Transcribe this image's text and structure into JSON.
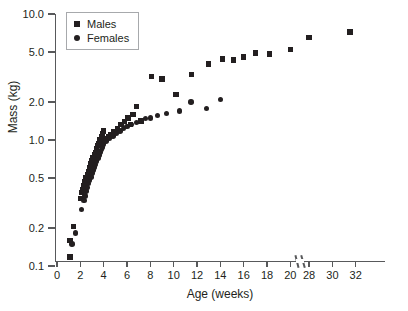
{
  "chart_data": {
    "type": "scatter",
    "title": "",
    "xlabel": "Age (weeks)",
    "ylabel": "Mass (kg)",
    "yscale": "log",
    "ylim": [
      0.1,
      10.0
    ],
    "ytick_labels": [
      "0.1",
      "0.2",
      "0.5",
      "1.0",
      "2.0",
      "5.0",
      "10.0"
    ],
    "ytick_values": [
      0.1,
      0.2,
      0.5,
      1.0,
      2.0,
      5.0,
      10.0
    ],
    "xlim": [
      0,
      32
    ],
    "xtick_labels": [
      "0",
      "2",
      "4",
      "6",
      "8",
      "10",
      "12",
      "14",
      "16",
      "18",
      "20",
      "28",
      "30",
      "32"
    ],
    "xtick_values": [
      0,
      2,
      4,
      6,
      8,
      10,
      12,
      14,
      16,
      18,
      20,
      28,
      30,
      32
    ],
    "axis_break": {
      "after": 20,
      "before": 28,
      "axis": "x"
    },
    "grid": false,
    "legend_position": "top-left",
    "marker_color": "#231f20",
    "axis_color": "#58595b",
    "series": [
      {
        "name": "Males",
        "marker": "square",
        "points": [
          [
            1.1,
            0.118
          ],
          [
            1.1,
            0.16
          ],
          [
            1.4,
            0.205
          ],
          [
            2.0,
            0.345
          ],
          [
            2.1,
            0.385
          ],
          [
            2.2,
            0.405
          ],
          [
            2.3,
            0.43
          ],
          [
            2.4,
            0.47
          ],
          [
            2.5,
            0.505
          ],
          [
            2.5,
            0.45
          ],
          [
            2.6,
            0.53
          ],
          [
            2.7,
            0.56
          ],
          [
            2.8,
            0.6
          ],
          [
            2.9,
            0.65
          ],
          [
            3.0,
            0.69
          ],
          [
            3.0,
            0.62
          ],
          [
            3.1,
            0.72
          ],
          [
            3.2,
            0.76
          ],
          [
            3.3,
            0.8
          ],
          [
            3.4,
            0.85
          ],
          [
            3.5,
            0.9
          ],
          [
            3.6,
            0.94
          ],
          [
            3.7,
            1.0
          ],
          [
            3.8,
            1.06
          ],
          [
            3.9,
            1.12
          ],
          [
            4.0,
            1.18
          ],
          [
            4.2,
            1.03
          ],
          [
            4.4,
            1.06
          ],
          [
            4.6,
            1.1
          ],
          [
            4.9,
            1.17
          ],
          [
            5.2,
            1.24
          ],
          [
            5.5,
            1.33
          ],
          [
            5.8,
            1.4
          ],
          [
            6.1,
            1.5
          ],
          [
            6.3,
            1.32
          ],
          [
            6.5,
            1.6
          ],
          [
            6.8,
            1.85
          ],
          [
            7.2,
            1.42
          ],
          [
            8.1,
            3.2
          ],
          [
            9.0,
            3.05
          ],
          [
            10.2,
            2.3
          ],
          [
            11.5,
            3.3
          ],
          [
            13.0,
            4.0
          ],
          [
            14.2,
            4.4
          ],
          [
            15.1,
            4.3
          ],
          [
            16.0,
            4.55
          ],
          [
            17.0,
            4.9
          ],
          [
            18.2,
            4.8
          ],
          [
            20.0,
            5.25
          ],
          [
            28.0,
            6.5
          ],
          [
            31.5,
            7.2
          ]
        ]
      },
      {
        "name": "Females",
        "marker": "circle",
        "points": [
          [
            1.3,
            0.15
          ],
          [
            1.6,
            0.182
          ],
          [
            2.1,
            0.28
          ],
          [
            2.3,
            0.33
          ],
          [
            2.4,
            0.36
          ],
          [
            2.5,
            0.395
          ],
          [
            2.6,
            0.42
          ],
          [
            2.7,
            0.45
          ],
          [
            2.8,
            0.48
          ],
          [
            2.9,
            0.51
          ],
          [
            3.0,
            0.545
          ],
          [
            3.1,
            0.58
          ],
          [
            3.2,
            0.61
          ],
          [
            3.3,
            0.64
          ],
          [
            3.4,
            0.68
          ],
          [
            3.5,
            0.72
          ],
          [
            3.6,
            0.76
          ],
          [
            3.7,
            0.8
          ],
          [
            3.8,
            0.84
          ],
          [
            3.9,
            0.88
          ],
          [
            4.0,
            0.93
          ],
          [
            4.2,
            0.98
          ],
          [
            4.5,
            1.03
          ],
          [
            4.8,
            1.08
          ],
          [
            5.1,
            1.13
          ],
          [
            5.4,
            1.18
          ],
          [
            5.7,
            1.23
          ],
          [
            6.0,
            1.28
          ],
          [
            6.4,
            1.33
          ],
          [
            6.8,
            1.38
          ],
          [
            7.2,
            1.43
          ],
          [
            7.6,
            1.48
          ],
          [
            8.0,
            1.5
          ],
          [
            8.6,
            1.56
          ],
          [
            9.4,
            1.62
          ],
          [
            10.5,
            1.7
          ],
          [
            11.5,
            2.0
          ],
          [
            12.8,
            1.78
          ],
          [
            14.0,
            2.1
          ]
        ]
      }
    ]
  },
  "legend": {
    "entries": [
      {
        "label": "Males",
        "marker": "square"
      },
      {
        "label": "Females",
        "marker": "circle"
      }
    ]
  }
}
